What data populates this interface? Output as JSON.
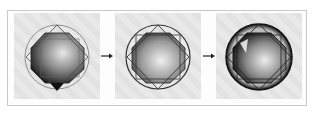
{
  "figure": {
    "panels": [
      {
        "name": "step-1",
        "label": ""
      },
      {
        "name": "step-2",
        "label": ""
      },
      {
        "name": "step-3",
        "label": ""
      }
    ],
    "arrows": [
      {
        "from": "step-1",
        "to": "step-2",
        "icon": "arrow-right-icon"
      },
      {
        "from": "step-2",
        "to": "step-3",
        "icon": "arrow-right-icon"
      }
    ],
    "colors": {
      "background": "#ffffff",
      "frame_border": "#c8c8c8",
      "panel": "#e6e6e6",
      "outline": "#333333",
      "dark_shade": "#1a1a1a"
    }
  }
}
